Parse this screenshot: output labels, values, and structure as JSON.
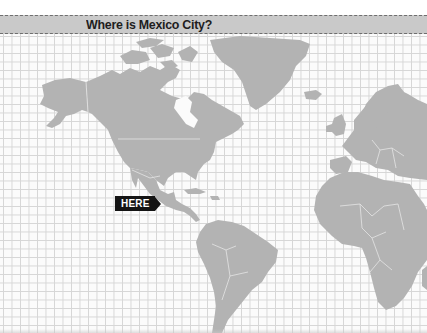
{
  "quiz": {
    "title": "Where is Mexico City?",
    "marker_label": "HERE"
  },
  "map": {
    "regions_shown": [
      "North America",
      "Greenland",
      "Central America",
      "South America",
      "Europe",
      "Africa"
    ],
    "land_color": "#b3b3b3",
    "grid_color": "#d6d6d6",
    "header_color": "#c9c9c9",
    "marker_color": "#141414"
  }
}
